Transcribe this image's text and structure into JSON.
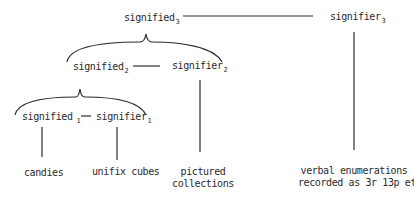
{
  "diagram": {
    "level3": {
      "signified": {
        "text": "signified",
        "sub": "3"
      },
      "signifier": {
        "text": "signifier",
        "sub": "3"
      }
    },
    "level2": {
      "signified": {
        "text": "signified",
        "sub": "2"
      },
      "signifier": {
        "text": "signifier",
        "sub": "2"
      }
    },
    "level1": {
      "signified": {
        "text": "signified",
        "sub": "1"
      },
      "signifier": {
        "text": "signifier",
        "sub": "1"
      }
    },
    "leaves": {
      "candies": "candies",
      "unifix": "unifix cubes",
      "pictured_line1": "pictured",
      "pictured_line2": "collections",
      "verbal_line1": "verbal enumerations",
      "verbal_line2": "recorded as 3r 13p etc."
    },
    "colors": {
      "ink": "#2a2a2a",
      "background": "#ffffff"
    }
  }
}
